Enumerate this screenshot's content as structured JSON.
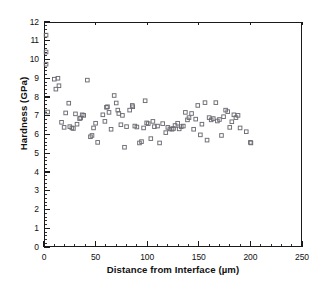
{
  "chart_data": {
    "type": "scatter",
    "title": "",
    "xlabel": "Distance from Interface (µm)",
    "ylabel": "Hardness (GPa)",
    "xlim": [
      0,
      250
    ],
    "ylim": [
      0,
      12
    ],
    "xticks": [
      0,
      50,
      100,
      150,
      200,
      250
    ],
    "xtick_labels": [
      "0",
      "50",
      "100",
      "150",
      "200",
      "250"
    ],
    "yticks": [
      0,
      1,
      2,
      3,
      4,
      5,
      6,
      7,
      8,
      9,
      10,
      11,
      12
    ],
    "ytick_labels": [
      "0",
      "1",
      "2",
      "3",
      "4",
      "5",
      "6",
      "7",
      "8",
      "9",
      "10",
      "11",
      "12"
    ],
    "x_minor_tick_interval": 10,
    "y_minor_tick_interval": 0.2,
    "grid": false,
    "legend": null,
    "marker": "open-square",
    "marker_size_px": 3.6,
    "marker_color": "#6b6b72",
    "series": [
      {
        "name": "Hardness vs distance",
        "points": [
          [
            2.0,
            11.3
          ],
          [
            2.0,
            10.4
          ],
          [
            2.0,
            9.75
          ],
          [
            3.5,
            7.2
          ],
          [
            10.0,
            8.95
          ],
          [
            11.5,
            8.42
          ],
          [
            13.5,
            9.0
          ],
          [
            14.5,
            8.6
          ],
          [
            17.0,
            6.65
          ],
          [
            19.5,
            6.38
          ],
          [
            21.0,
            7.15
          ],
          [
            24.0,
            7.67
          ],
          [
            25.0,
            6.42
          ],
          [
            27.0,
            6.35
          ],
          [
            28.5,
            6.32
          ],
          [
            30.5,
            7.1
          ],
          [
            32.0,
            6.55
          ],
          [
            34.5,
            6.85
          ],
          [
            35.5,
            6.88
          ],
          [
            37.0,
            7.05
          ],
          [
            38.5,
            7.02
          ],
          [
            42.0,
            8.9
          ],
          [
            45.0,
            5.88
          ],
          [
            46.5,
            5.95
          ],
          [
            48.0,
            6.35
          ],
          [
            50.0,
            6.6
          ],
          [
            52.0,
            5.58
          ],
          [
            57.0,
            7.05
          ],
          [
            59.0,
            6.7
          ],
          [
            60.5,
            7.45
          ],
          [
            61.5,
            7.48
          ],
          [
            63.0,
            7.18
          ],
          [
            65.0,
            6.28
          ],
          [
            68.0,
            8.08
          ],
          [
            70.0,
            7.68
          ],
          [
            71.5,
            7.3
          ],
          [
            72.5,
            7.12
          ],
          [
            74.5,
            6.52
          ],
          [
            76.0,
            7.02
          ],
          [
            78.0,
            5.32
          ],
          [
            80.0,
            6.42
          ],
          [
            83.0,
            7.3
          ],
          [
            85.5,
            7.55
          ],
          [
            86.0,
            7.48
          ],
          [
            88.0,
            6.45
          ],
          [
            90.0,
            6.4
          ],
          [
            92.5,
            5.55
          ],
          [
            94.5,
            5.62
          ],
          [
            96.5,
            6.35
          ],
          [
            98.0,
            7.8
          ],
          [
            99.5,
            6.62
          ],
          [
            101.0,
            6.58
          ],
          [
            103.5,
            5.78
          ],
          [
            105.5,
            6.7
          ],
          [
            107.0,
            6.42
          ],
          [
            110.0,
            6.45
          ],
          [
            112.0,
            5.55
          ],
          [
            115.0,
            6.58
          ],
          [
            118.0,
            6.1
          ],
          [
            120.0,
            6.38
          ],
          [
            122.0,
            6.3
          ],
          [
            124.0,
            6.28
          ],
          [
            125.5,
            6.32
          ],
          [
            127.0,
            6.48
          ],
          [
            129.5,
            6.6
          ],
          [
            131.0,
            6.3
          ],
          [
            133.0,
            6.42
          ],
          [
            135.0,
            6.45
          ],
          [
            137.0,
            7.18
          ],
          [
            139.0,
            6.78
          ],
          [
            140.5,
            6.9
          ],
          [
            143.0,
            7.12
          ],
          [
            145.0,
            6.28
          ],
          [
            147.0,
            6.82
          ],
          [
            149.0,
            7.55
          ],
          [
            151.5,
            5.98
          ],
          [
            153.0,
            6.55
          ],
          [
            156.0,
            7.7
          ],
          [
            158.0,
            5.7
          ],
          [
            160.0,
            6.9
          ],
          [
            162.0,
            6.78
          ],
          [
            164.0,
            6.85
          ],
          [
            166.5,
            7.7
          ],
          [
            168.0,
            6.72
          ],
          [
            170.0,
            6.8
          ],
          [
            172.0,
            5.95
          ],
          [
            174.0,
            6.95
          ],
          [
            176.0,
            7.3
          ],
          [
            178.0,
            7.22
          ],
          [
            180.0,
            6.38
          ],
          [
            182.0,
            6.68
          ],
          [
            184.0,
            7.05
          ],
          [
            186.0,
            6.9
          ],
          [
            188.0,
            7.02
          ],
          [
            190.0,
            6.35
          ],
          [
            196.0,
            6.15
          ],
          [
            200.0,
            5.58
          ],
          [
            200.5,
            5.55
          ]
        ]
      }
    ]
  }
}
